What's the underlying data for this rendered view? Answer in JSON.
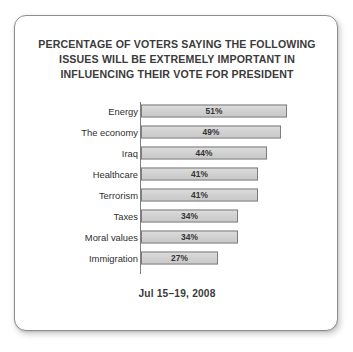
{
  "card": {
    "title_lines": [
      "PERCENTAGE OF VOTERS SAYING THE FOLLOWING",
      "ISSUES WILL BE EXTREMELY IMPORTANT IN",
      "INFLUENCING THEIR VOTE FOR PRESIDENT"
    ],
    "footer_date": "Jul 15–19, 2008"
  },
  "colors": {
    "bar_fill": "#d5d5d5",
    "bar_border": "#7d7d7d",
    "axis": "#808080",
    "text": "#333333",
    "card_border": "#8d8d8d",
    "background": "#ffffff"
  },
  "chart_data": {
    "type": "bar",
    "orientation": "horizontal",
    "title": "PERCENTAGE OF VOTERS SAYING THE FOLLOWING ISSUES WILL BE EXTREMELY IMPORTANT IN INFLUENCING THEIR VOTE FOR PRESIDENT",
    "subtitle": "Jul 15–19, 2008",
    "xlabel": "",
    "ylabel": "",
    "xlim": [
      0,
      60
    ],
    "grid": false,
    "legend": "none",
    "categories": [
      "Energy",
      "The economy",
      "Iraq",
      "Healthcare",
      "Terrorism",
      "Taxes",
      "Moral values",
      "Immigration"
    ],
    "values": [
      51,
      49,
      44,
      41,
      41,
      34,
      34,
      27
    ],
    "value_labels": [
      "51%",
      "49%",
      "44%",
      "41%",
      "41%",
      "34%",
      "34%",
      "27%"
    ],
    "bars": [
      {
        "category": "Energy",
        "value": 51,
        "label": "51%"
      },
      {
        "category": "The economy",
        "value": 49,
        "label": "49%"
      },
      {
        "category": "Iraq",
        "value": 44,
        "label": "44%"
      },
      {
        "category": "Healthcare",
        "value": 41,
        "label": "41%"
      },
      {
        "category": "Terrorism",
        "value": 41,
        "label": "41%"
      },
      {
        "category": "Taxes",
        "value": 34,
        "label": "34%"
      },
      {
        "category": "Moral values",
        "value": 34,
        "label": "34%"
      },
      {
        "category": "Immigration",
        "value": 27,
        "label": "27%"
      }
    ]
  }
}
